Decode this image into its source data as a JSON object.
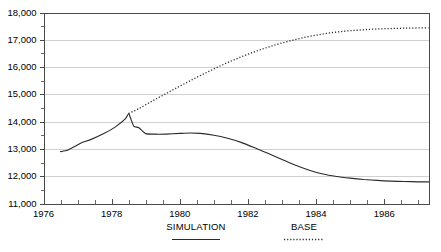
{
  "chart_data": {
    "type": "line",
    "title": "",
    "subtitle": "",
    "xlabel": "",
    "ylabel": "",
    "xlim": [
      1976,
      1987.3
    ],
    "ylim": [
      11000,
      18000
    ],
    "grid": true,
    "legend_position": "bottom",
    "y_ticks": [
      "11,000",
      "12,000",
      "13,000",
      "14,000",
      "15,000",
      "16,000",
      "17,000",
      "18,000"
    ],
    "y_tick_values": [
      11000,
      12000,
      13000,
      14000,
      15000,
      16000,
      17000,
      18000
    ],
    "y_minor_step": 500,
    "x_ticks": [
      "1976",
      "1978",
      "1980",
      "1982",
      "1984",
      "1986"
    ],
    "x_tick_values": [
      1976,
      1978,
      1980,
      1982,
      1984,
      1986
    ],
    "x_minor_step": 0.5,
    "series": [
      {
        "name": "SIMULATION",
        "style": "solid",
        "color": "#2b2b2b",
        "x": [
          1976.5,
          1976.7,
          1976.9,
          1977.1,
          1977.4,
          1977.8,
          1978.1,
          1978.4,
          1978.5,
          1978.55,
          1978.65,
          1978.8,
          1979.0,
          1979.3,
          1979.6,
          1980.0,
          1980.3,
          1980.6,
          1981.0,
          1981.4,
          1981.8,
          1982.2,
          1982.6,
          1983.0,
          1983.4,
          1983.8,
          1984.2,
          1984.6,
          1985.0,
          1985.4,
          1985.8,
          1986.2,
          1986.6,
          1987.0,
          1987.3
        ],
        "y": [
          12900,
          12950,
          13080,
          13220,
          13350,
          13580,
          13800,
          14100,
          14300,
          14150,
          13830,
          13780,
          13560,
          13540,
          13545,
          13570,
          13585,
          13570,
          13500,
          13390,
          13240,
          13040,
          12830,
          12610,
          12400,
          12220,
          12080,
          11990,
          11930,
          11880,
          11845,
          11820,
          11805,
          11795,
          11790
        ]
      },
      {
        "name": "BASE",
        "style": "dotted",
        "color": "#2b2b2b",
        "x": [
          1978.5,
          1978.8,
          1979.2,
          1979.6,
          1980.0,
          1980.4,
          1980.8,
          1981.2,
          1981.6,
          1982.0,
          1982.4,
          1982.8,
          1983.2,
          1983.6,
          1984.0,
          1984.4,
          1984.8,
          1985.2,
          1985.6,
          1986.0,
          1986.4,
          1986.8,
          1987.3
        ],
        "y": [
          14300,
          14480,
          14760,
          15030,
          15300,
          15560,
          15810,
          16050,
          16270,
          16470,
          16650,
          16810,
          16950,
          17070,
          17170,
          17250,
          17310,
          17350,
          17385,
          17405,
          17420,
          17430,
          17440
        ]
      }
    ],
    "annotations": []
  },
  "legend": {
    "items": [
      {
        "label": "SIMULATION",
        "style": "solid"
      },
      {
        "label": "BASE",
        "style": "dotted"
      }
    ]
  }
}
